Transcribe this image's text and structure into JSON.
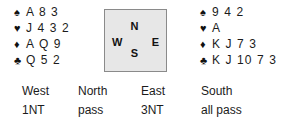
{
  "diagram": {
    "hands": [
      {
        "seat": "West",
        "position": "west",
        "suits": [
          {
            "suit": "spades",
            "pip": "♠",
            "cards": "A 8 3"
          },
          {
            "suit": "hearts",
            "pip": "♥",
            "cards": "J 4 3 2"
          },
          {
            "suit": "diamonds",
            "pip": "♦",
            "cards": "A Q 9"
          },
          {
            "suit": "clubs",
            "pip": "♣",
            "cards": "Q 5 2"
          }
        ]
      },
      {
        "seat": "South",
        "position": "south",
        "suits": [
          {
            "suit": "spades",
            "pip": "♠",
            "cards": "9 4 2"
          },
          {
            "suit": "hearts",
            "pip": "♥",
            "cards": "A"
          },
          {
            "suit": "diamonds",
            "pip": "♦",
            "cards": "K J 7 3"
          },
          {
            "suit": "clubs",
            "pip": "♣",
            "cards": "K J 10 7 3"
          }
        ]
      }
    ],
    "compass": {
      "north": "N",
      "west": "W",
      "east": "E",
      "south": "S",
      "fill_color": "#e7e7e7",
      "border_color": "#8a8a8a"
    },
    "auction": {
      "columns": [
        {
          "seat": "West",
          "call": "1NT"
        },
        {
          "seat": "North",
          "call": "pass"
        },
        {
          "seat": "East",
          "call": "3NT"
        },
        {
          "seat": "South",
          "call": "all pass"
        }
      ]
    },
    "colors": {
      "background": "#ffffff",
      "text": "#1b1b1b"
    }
  }
}
